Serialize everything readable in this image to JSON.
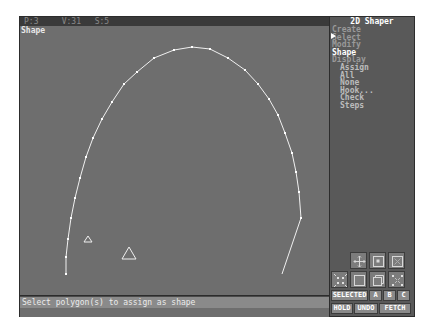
{
  "topbar": {
    "polygons": "P:3",
    "vertices": "V:31",
    "shapes": "S:5"
  },
  "viewport": {
    "label": "Shape"
  },
  "status": {
    "message": "Select polygon(s) to assign as shape"
  },
  "panel": {
    "title": "2D Shaper",
    "menu": [
      {
        "label": "Create",
        "style": "dim"
      },
      {
        "label": "Select",
        "style": "dim"
      },
      {
        "label": "Modify",
        "style": "dim"
      },
      {
        "label": "Shape",
        "style": "white"
      },
      {
        "label": "Display",
        "style": "dim"
      }
    ],
    "submenu": [
      "Assign",
      "All",
      "None",
      "Hook...",
      "Check",
      "Steps"
    ]
  },
  "icon_buttons": [
    {
      "name": "pan-icon"
    },
    {
      "name": "zoom-window-icon"
    },
    {
      "name": "zoom-extents-icon"
    },
    {
      "name": "zoom-extents-all-icon"
    },
    {
      "name": "full-screen-icon"
    },
    {
      "name": "zoom-all-icon"
    },
    {
      "name": "zoom-out-icon"
    }
  ],
  "buttons": {
    "selected": "SELECTED",
    "a": "A",
    "b": "B",
    "c": "C",
    "hold": "HOLD",
    "undo": "UNDO",
    "fetch": "FETCH"
  },
  "colors": {
    "viewport_bg": "#6e6e6e",
    "panel_bg": "#595959",
    "curve": "#f0f0f0"
  }
}
